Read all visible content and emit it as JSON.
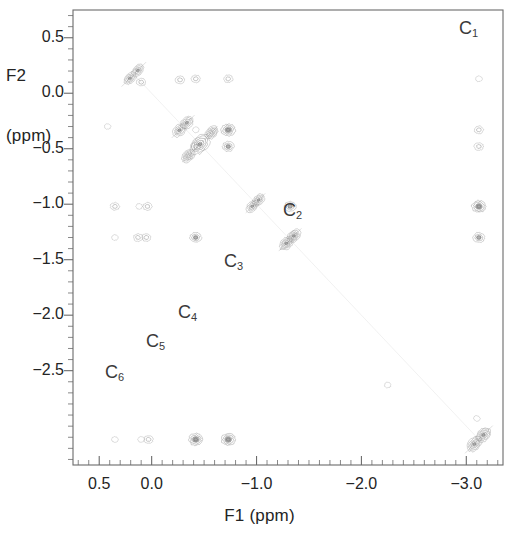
{
  "figure": {
    "kind": "2d-nmr-contour-spectrum",
    "background_color": "#ffffff",
    "frame_color": "#6b6b6b",
    "contour_color": "#707070",
    "axes": {
      "x": {
        "label": "F1 (ppm)",
        "tick_labels": [
          "0.5",
          "0.0",
          "-1.0",
          "-2.0",
          "-3.0"
        ],
        "tick_values": [
          0.5,
          0.0,
          -1.0,
          -2.0,
          -3.0
        ],
        "range": [
          0.75,
          -3.35
        ],
        "minor_tick_step": 0.1
      },
      "y": {
        "label": "F2\n(ppm)",
        "label_line1": "F2",
        "label_line2": "(ppm)",
        "tick_labels": [
          "-2.5",
          "-2.0",
          "-1.5",
          "-1.0",
          "-0.5",
          "0.0",
          "0.5"
        ],
        "tick_values": [
          -2.5,
          -2.0,
          -1.5,
          -1.0,
          -0.5,
          0.0,
          0.5
        ],
        "range": [
          -3.35,
          0.75
        ],
        "minor_tick_step": 0.1
      }
    },
    "peak_labels": [
      {
        "name": "C1",
        "text": "C",
        "sub": "1",
        "x_px": 459,
        "y_px": 18
      },
      {
        "name": "C2",
        "text": "C",
        "sub": "2",
        "x_px": 283,
        "y_px": 200
      },
      {
        "name": "C3",
        "text": "C",
        "sub": "3",
        "x_px": 224,
        "y_px": 251
      },
      {
        "name": "C4",
        "text": "C",
        "sub": "4",
        "x_px": 178,
        "y_px": 302
      },
      {
        "name": "C5",
        "text": "C",
        "sub": "5",
        "x_px": 146,
        "y_px": 331
      },
      {
        "name": "C6",
        "text": "C",
        "sub": "6",
        "x_px": 105,
        "y_px": 362
      }
    ]
  },
  "chart_data": {
    "type": "scatter",
    "title": "",
    "xlabel": "F1 (ppm)",
    "ylabel": "F2 (ppm)",
    "xlim": [
      0.75,
      -3.35
    ],
    "ylim": [
      -3.35,
      0.75
    ],
    "xticks": [
      0.5,
      0.0,
      -1.0,
      -2.0,
      -3.0
    ],
    "yticks": [
      -2.5,
      -2.0,
      -1.5,
      -1.0,
      -0.5,
      0.0,
      0.5
    ],
    "grid": false,
    "legend": false,
    "diagonal_peaks": [
      {
        "label": "C1",
        "f1": -3.12,
        "f2": -3.12,
        "intensity": 5,
        "rx": 17,
        "ry": 10,
        "rot": -45
      },
      {
        "label": "C2",
        "f1": -1.32,
        "f2": -1.32,
        "intensity": 5,
        "rx": 14,
        "ry": 9,
        "rot": -45
      },
      {
        "label": "C3",
        "f1": -0.99,
        "f2": -0.99,
        "intensity": 4,
        "rx": 12,
        "ry": 8,
        "rot": -45
      },
      {
        "label": "C4",
        "f1": -0.46,
        "f2": -0.46,
        "intensity": 5,
        "rx": 22,
        "ry": 11,
        "rot": -45
      },
      {
        "label": "C5",
        "f1": -0.3,
        "f2": -0.3,
        "intensity": 4,
        "rx": 14,
        "ry": 9,
        "rot": -45
      },
      {
        "label": "C6",
        "f1": 0.17,
        "f2": 0.17,
        "intensity": 4,
        "rx": 15,
        "ry": 8,
        "rot": -45
      }
    ],
    "cross_peaks": [
      {
        "f1": 0.35,
        "f2": -3.12,
        "intensity": 1
      },
      {
        "f1": 0.1,
        "f2": -3.12,
        "intensity": 1
      },
      {
        "f1": 0.03,
        "f2": -3.12,
        "intensity": 2
      },
      {
        "f1": -0.42,
        "f2": -3.12,
        "intensity": 4
      },
      {
        "f1": -0.73,
        "f2": -3.12,
        "intensity": 4
      },
      {
        "f1": -3.1,
        "f2": -2.93,
        "intensity": 1
      },
      {
        "f1": -2.25,
        "f2": -2.63,
        "intensity": 1
      },
      {
        "f1": 0.35,
        "f2": -1.3,
        "intensity": 1
      },
      {
        "f1": 0.13,
        "f2": -1.3,
        "intensity": 2
      },
      {
        "f1": 0.05,
        "f2": -1.3,
        "intensity": 2
      },
      {
        "f1": -0.42,
        "f2": -1.3,
        "intensity": 3
      },
      {
        "f1": -3.12,
        "f2": -1.3,
        "intensity": 3
      },
      {
        "f1": 0.35,
        "f2": -1.02,
        "intensity": 2
      },
      {
        "f1": 0.12,
        "f2": -1.02,
        "intensity": 1
      },
      {
        "f1": 0.04,
        "f2": -1.02,
        "intensity": 2
      },
      {
        "f1": -1.32,
        "f2": -1.02,
        "intensity": 3
      },
      {
        "f1": -3.12,
        "f2": -1.02,
        "intensity": 4
      },
      {
        "f1": -0.42,
        "f2": -0.48,
        "intensity": 2
      },
      {
        "f1": -0.73,
        "f2": -0.48,
        "intensity": 3
      },
      {
        "f1": -3.12,
        "f2": -0.48,
        "intensity": 2
      },
      {
        "f1": -0.42,
        "f2": -0.33,
        "intensity": 1
      },
      {
        "f1": -0.73,
        "f2": -0.33,
        "intensity": 4
      },
      {
        "f1": -3.12,
        "f2": -0.33,
        "intensity": 2
      },
      {
        "f1": 0.1,
        "f2": 0.1,
        "intensity": 2
      },
      {
        "f1": -0.42,
        "f2": 0.13,
        "intensity": 2
      },
      {
        "f1": -0.73,
        "f2": 0.13,
        "intensity": 2
      },
      {
        "f1": -3.12,
        "f2": 0.13,
        "intensity": 1
      },
      {
        "f1": 0.42,
        "f2": -0.3,
        "intensity": 1
      },
      {
        "f1": -0.27,
        "f2": 0.12,
        "intensity": 2
      }
    ]
  }
}
